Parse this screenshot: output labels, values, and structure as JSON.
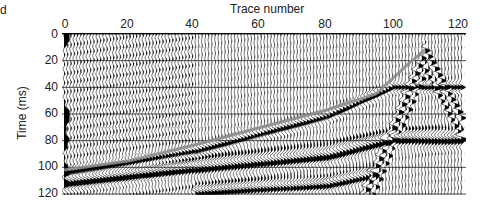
{
  "panel_label": "d",
  "chart_data": {
    "type": "seismic_wiggle",
    "title": "",
    "xlabel": "Trace number",
    "ylabel": "Time (ms)",
    "x_axis_position": "top",
    "xlim": [
      0,
      122
    ],
    "ylim": [
      0,
      122
    ],
    "y_inverted": true,
    "x_ticks": [
      0,
      20,
      40,
      60,
      80,
      100,
      120
    ],
    "y_ticks": [
      0,
      20,
      40,
      60,
      80,
      100,
      120
    ],
    "grid": true,
    "num_traces": 122,
    "annotations": {
      "first_break_pick_line": {
        "color": "#8a8a8a",
        "points": [
          [
            0,
            102
          ],
          [
            20,
            95
          ],
          [
            40,
            83
          ],
          [
            60,
            70
          ],
          [
            80,
            57
          ],
          [
            95,
            45
          ],
          [
            105,
            22
          ],
          [
            110,
            12
          ]
        ]
      }
    },
    "events": [
      {
        "name": "first arrival / refraction",
        "points": [
          [
            0,
            104
          ],
          [
            40,
            88
          ],
          [
            80,
            62
          ],
          [
            100,
            40
          ]
        ]
      },
      {
        "name": "surface wave band",
        "points": [
          [
            0,
            110
          ],
          [
            40,
            100
          ],
          [
            80,
            90
          ],
          [
            100,
            78
          ]
        ]
      },
      {
        "name": "deep reflection band",
        "points": [
          [
            40,
            118
          ],
          [
            80,
            112
          ],
          [
            95,
            104
          ]
        ]
      },
      {
        "name": "apex hyperbola",
        "apex": [
          110,
          12
        ],
        "left_limb_end": [
          92,
          120
        ],
        "right_limb_end": [
          120,
          60
        ]
      }
    ],
    "colors": {
      "fill": "#000000",
      "grid": "#000000",
      "pick_line": "#8a8a8a",
      "background": "#ffffff"
    }
  },
  "axes": {
    "x_title": "Trace number",
    "y_title": "Time (ms)",
    "x_tick_labels": [
      "0",
      "20",
      "40",
      "60",
      "80",
      "100",
      "120"
    ],
    "y_tick_labels": [
      "0",
      "20",
      "40",
      "60",
      "80",
      "100",
      "120"
    ]
  }
}
